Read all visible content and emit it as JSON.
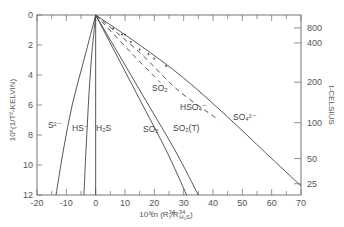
{
  "chart_data": {
    "type": "line",
    "title": "",
    "xlabel": "10^3 ln (R_i^34 / R_H2S^34)",
    "ylabel": "10^6(1/T^2-KELVIN)",
    "ylabel_right": "t-CELSIUS",
    "xlim": [
      -20,
      70
    ],
    "ylim": [
      0,
      12
    ],
    "y_inverted": true,
    "grid": false,
    "x_ticks": [
      -20,
      -10,
      0,
      10,
      20,
      30,
      40,
      50,
      60,
      70
    ],
    "y_ticks": [
      0,
      2,
      4,
      6,
      8,
      10,
      12
    ],
    "right_ticks": [
      {
        "label": "800",
        "y": 0.86
      },
      {
        "label": "400",
        "y": 1.86
      },
      {
        "label": "200",
        "y": 4.48
      },
      {
        "label": "100",
        "y": 7.18
      },
      {
        "label": "50",
        "y": 9.57
      },
      {
        "label": "25",
        "y": 11.25
      }
    ],
    "series": [
      {
        "name": "S2-",
        "label": "S²⁻",
        "style": "solid",
        "points": [
          [
            0,
            0
          ],
          [
            -4,
            3
          ],
          [
            -8,
            6
          ],
          [
            -11,
            9
          ],
          [
            -13.5,
            12
          ]
        ]
      },
      {
        "name": "HS-",
        "label": "HS⁻",
        "style": "solid",
        "points": [
          [
            0,
            0
          ],
          [
            -1.5,
            3
          ],
          [
            -2.5,
            6
          ],
          [
            -3.3,
            9
          ],
          [
            -4,
            12
          ]
        ]
      },
      {
        "name": "H2S",
        "label": "H₂S",
        "style": "solid",
        "points": [
          [
            0,
            0
          ],
          [
            0,
            12
          ]
        ]
      },
      {
        "name": "SO2",
        "label": "SO₂",
        "style": "solid",
        "points": [
          [
            0,
            0
          ],
          [
            8,
            3
          ],
          [
            16,
            6
          ],
          [
            24,
            9
          ],
          [
            31,
            12
          ]
        ]
      },
      {
        "name": "SO2(T)",
        "label": "SO₂(T)",
        "style": "solid",
        "points": [
          [
            0,
            0
          ],
          [
            9,
            3
          ],
          [
            18,
            6
          ],
          [
            27,
            9
          ],
          [
            35,
            12
          ]
        ]
      },
      {
        "name": "SO2 (dashed)",
        "label": "SO₂",
        "style": "dashed",
        "points": [
          [
            0,
            0
          ],
          [
            12,
            2.5
          ],
          [
            22,
            4.5
          ]
        ]
      },
      {
        "name": "HSO4-",
        "label": "HSO₄⁻",
        "style": "dashed",
        "points": [
          [
            0,
            0
          ],
          [
            15,
            2.5
          ],
          [
            28,
            5
          ],
          [
            42,
            7
          ]
        ]
      },
      {
        "name": "SO4 2-",
        "label": "SO₄²⁻",
        "style": "solid",
        "points": [
          [
            0,
            0
          ],
          [
            15,
            2
          ],
          [
            30,
            4.2
          ],
          [
            45,
            6.8
          ],
          [
            58,
            9.2
          ],
          [
            70,
            11.4
          ]
        ]
      }
    ]
  },
  "labels": {
    "y_axis_title": "10⁶(1/T²-KELVIN)",
    "right_axis_title": "t-CELSIUS",
    "x_axis_title_main": "10³ℓn (R",
    "x_axis_title_i": "i",
    "x_axis_title_mid": "/R",
    "x_axis_title_sub": "H₂S",
    "x_axis_title_end": ")",
    "sup34": "34"
  }
}
